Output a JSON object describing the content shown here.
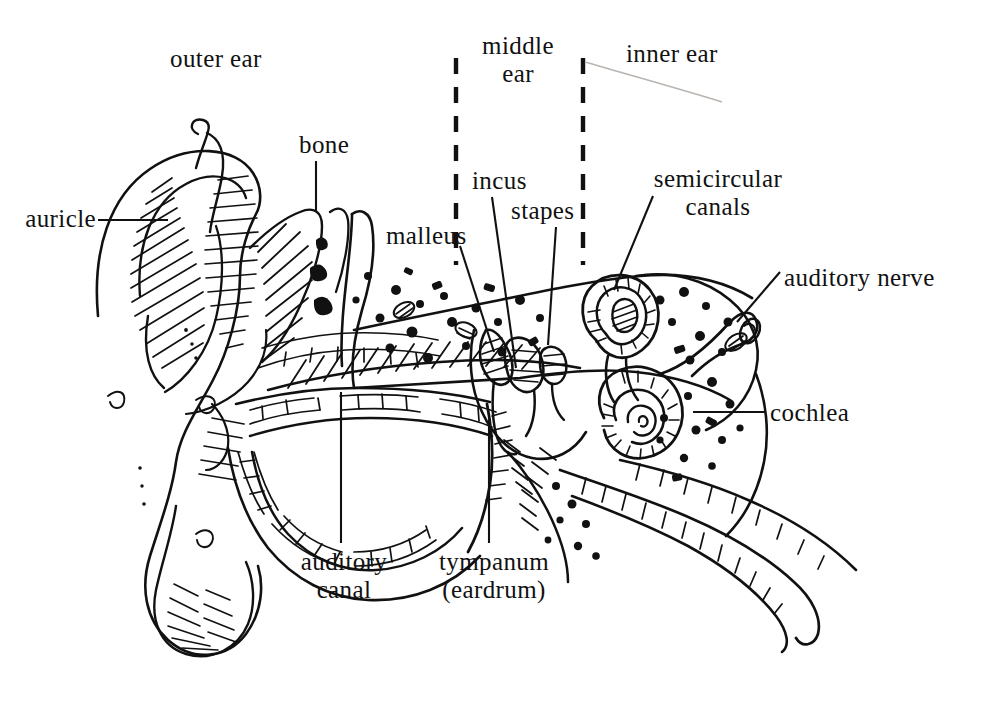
{
  "figure": {
    "style": "pen-and-ink cross-section line drawing",
    "background_color": "#ffffff",
    "ink_color": "#111111",
    "width": 995,
    "height": 703
  },
  "regions": [
    {
      "id": "outer-ear",
      "label": "outer ear",
      "x": 170,
      "y": 53
    },
    {
      "id": "middle-ear",
      "label_line1": "middle",
      "label_line2": "ear",
      "x": 517,
      "y": 40
    },
    {
      "id": "inner-ear",
      "label": "inner ear",
      "x": 678,
      "y": 45
    }
  ],
  "dividers": [
    {
      "id": "outer-middle-divider",
      "x": 456,
      "y_top": 58,
      "y_bottom": 265
    },
    {
      "id": "middle-inner-divider",
      "x": 583,
      "y_top": 58,
      "y_bottom": 265
    }
  ],
  "labels": {
    "auricle": {
      "text": "auricle",
      "x": 14,
      "y": 209
    },
    "bone": {
      "text": "bone",
      "x": 301,
      "y": 133
    },
    "malleus": {
      "text": "malleus",
      "x": 390,
      "y": 224
    },
    "incus": {
      "text": "incus",
      "x": 476,
      "y": 170
    },
    "stapes": {
      "text": "stapes",
      "x": 513,
      "y": 198
    },
    "semicircular_canals": {
      "line1": "semicircular",
      "line2": "canals",
      "x": 637,
      "y": 168
    },
    "auditory_nerve": {
      "text": "auditory nerve",
      "x": 786,
      "y": 265
    },
    "cochlea": {
      "text": "cochlea",
      "x": 772,
      "y": 401
    },
    "auditory_canal": {
      "line1": "auditory",
      "line2": "canal",
      "x": 302,
      "y": 551
    },
    "tympanum": {
      "line1": "tympanum",
      "line2": "(eardrum)",
      "x": 432,
      "y": 551
    }
  },
  "leader_lines": [
    {
      "for": "auricle",
      "x1": 98,
      "y1": 220,
      "x2": 168,
      "y2": 220
    },
    {
      "for": "bone",
      "x1": 316,
      "y1": 161,
      "x2": 316,
      "y2": 212
    },
    {
      "for": "malleus",
      "x1": 460,
      "y1": 246,
      "x2": 494,
      "y2": 352
    },
    {
      "for": "incus",
      "x1": 492,
      "y1": 197,
      "x2": 516,
      "y2": 368
    },
    {
      "for": "stapes",
      "x1": 556,
      "y1": 227,
      "x2": 548,
      "y2": 345
    },
    {
      "for": "semicircular-canals",
      "x1": 653,
      "y1": 196,
      "x2": 614,
      "y2": 290
    },
    {
      "for": "auditory-nerve",
      "x1": 780,
      "y1": 272,
      "x2": 737,
      "y2": 322
    },
    {
      "for": "cochlea",
      "x1": 766,
      "y1": 412,
      "x2": 693,
      "y2": 412
    },
    {
      "for": "auditory-canal",
      "x1": 341,
      "y1": 543,
      "x2": 341,
      "y2": 392
    },
    {
      "for": "tympanum",
      "x1": 489,
      "y1": 543,
      "x2": 489,
      "y2": 420
    }
  ],
  "anatomy_parts": [
    "auricle",
    "auditory canal",
    "tympanum (eardrum)",
    "malleus",
    "incus",
    "stapes",
    "semicircular canals",
    "cochlea",
    "auditory nerve",
    "bone",
    "eustachian tube",
    "earlobe"
  ]
}
